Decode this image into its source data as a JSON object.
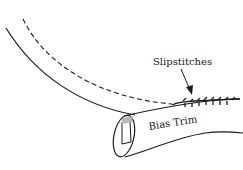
{
  "diagram": {
    "labels": {
      "slipstitches": "Slipstitches",
      "bias_trim": "Bias Trim"
    },
    "colors": {
      "line": "#1a1a1a",
      "background": "#ffffff",
      "shade": "#b8b8b8"
    }
  }
}
